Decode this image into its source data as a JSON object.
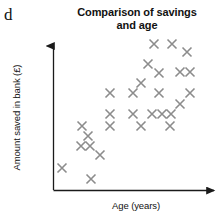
{
  "figure": {
    "part_letter": "d"
  },
  "chart_data": {
    "type": "scatter",
    "title": "Comparison of savings and age",
    "title_line1": "Comparison of savings",
    "title_line2": "and age",
    "xlabel": "Age (years)",
    "ylabel": "Amount saved in bank (£)",
    "grid": false,
    "legend": null,
    "marker": {
      "shape": "x",
      "color": "#8c8c8c",
      "size": 9,
      "stroke_width": 1.6
    },
    "axis": {
      "color": "#1a1a1a",
      "arrowheads": true,
      "ticks": false,
      "tick_labels": false,
      "x_range_px": [
        53,
        218
      ],
      "y_range_px": [
        42,
        190
      ]
    },
    "n_points": 28,
    "x": [
      62,
      82,
      91,
      88,
      81,
      90,
      100,
      110,
      110,
      110,
      133,
      133,
      141,
      141,
      152,
      159,
      159,
      162,
      170,
      148,
      154,
      172,
      180,
      180,
      190,
      187,
      171,
      190
    ],
    "y": [
      168,
      126,
      179,
      136,
      146,
      146,
      155,
      93,
      114,
      126,
      93,
      114,
      83,
      126,
      114,
      73,
      93,
      114,
      126,
      64,
      44,
      44,
      72,
      104,
      72,
      52,
      114,
      72
    ],
    "points_note": "Positive correlation: savings increase with age",
    "points": [
      {
        "x": 62,
        "y": 168
      },
      {
        "x": 82,
        "y": 126
      },
      {
        "x": 88,
        "y": 136
      },
      {
        "x": 81,
        "y": 146
      },
      {
        "x": 90,
        "y": 146
      },
      {
        "x": 91,
        "y": 179
      },
      {
        "x": 100,
        "y": 155
      },
      {
        "x": 110,
        "y": 93
      },
      {
        "x": 110,
        "y": 114
      },
      {
        "x": 110,
        "y": 126
      },
      {
        "x": 133,
        "y": 93
      },
      {
        "x": 133,
        "y": 114
      },
      {
        "x": 141,
        "y": 83
      },
      {
        "x": 141,
        "y": 126
      },
      {
        "x": 148,
        "y": 64
      },
      {
        "x": 152,
        "y": 114
      },
      {
        "x": 154,
        "y": 44
      },
      {
        "x": 159,
        "y": 73
      },
      {
        "x": 159,
        "y": 93
      },
      {
        "x": 162,
        "y": 114
      },
      {
        "x": 170,
        "y": 126
      },
      {
        "x": 171,
        "y": 114
      },
      {
        "x": 172,
        "y": 44
      },
      {
        "x": 180,
        "y": 72
      },
      {
        "x": 180,
        "y": 104
      },
      {
        "x": 187,
        "y": 52
      },
      {
        "x": 190,
        "y": 72
      },
      {
        "x": 190,
        "y": 93
      }
    ]
  }
}
